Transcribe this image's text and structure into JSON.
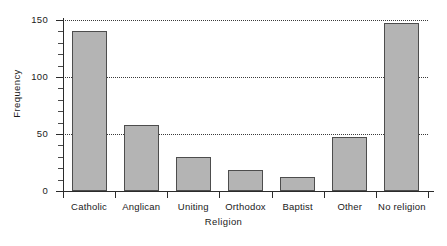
{
  "chart_data": {
    "type": "bar",
    "title": "",
    "xlabel": "Religion",
    "ylabel": "Frequency",
    "categories": [
      "Catholic",
      "Anglican",
      "Uniting",
      "Orthodox",
      "Baptist",
      "Other",
      "No religion"
    ],
    "values": [
      140,
      58,
      30,
      18,
      12,
      47,
      147
    ],
    "ylim": [
      0,
      150
    ],
    "yticks": [
      0,
      50,
      100,
      150
    ],
    "ytick_labels": [
      "0",
      "50",
      "100",
      "150"
    ],
    "minor_tick_interval": 10,
    "grid": "horizontal-dotted",
    "legend": "none",
    "bar_fill_color": "#b4b4b4",
    "bar_border_color": "#4d4d4d",
    "axis_color": "#2b2b2b",
    "grid_color": "#3a3a3a",
    "background_color": "#ffffff"
  }
}
